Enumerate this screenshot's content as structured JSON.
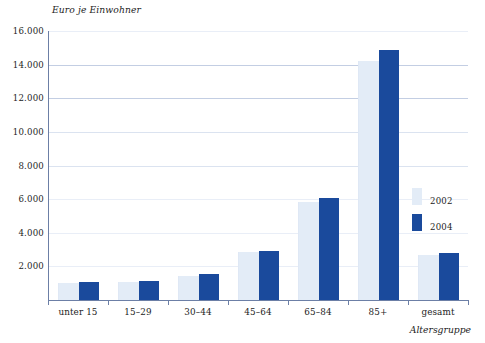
{
  "chart_data": {
    "type": "bar",
    "title": "",
    "subtitle": "",
    "ylabel": "Euro je Einwohner",
    "xlabel": "Altersgruppe",
    "categories": [
      "unter 15",
      "15–29",
      "30–44",
      "45–64",
      "65–84",
      "85+",
      "gesamt"
    ],
    "series": [
      {
        "name": "2002",
        "color": "#e3ecf7",
        "values": [
          1000,
          1050,
          1450,
          2850,
          5850,
          14200,
          2700
        ]
      },
      {
        "name": "2004",
        "color": "#1a4a9c",
        "values": [
          1100,
          1150,
          1550,
          2900,
          6050,
          14850,
          2800
        ]
      }
    ],
    "ylim": [
      0,
      16000
    ],
    "ytick_values": [
      16000,
      14000,
      12000,
      10000,
      8000,
      6000,
      4000,
      2000
    ],
    "ytick_labels": [
      "16.000",
      "14.000",
      "12.000",
      "10.000",
      "8.000",
      "6.000",
      "4.000",
      "2.000"
    ],
    "grid": "horizontal",
    "legend_position": "right",
    "legend_entries": [
      "2002",
      "2004"
    ]
  },
  "colors": {
    "series_2002": "#e3ecf7",
    "series_2004": "#1a4a9c",
    "axis": "#6c7fa6",
    "grid_top": "#8a9ec4",
    "text": "#1d1d1d",
    "background": "#ffffff"
  }
}
